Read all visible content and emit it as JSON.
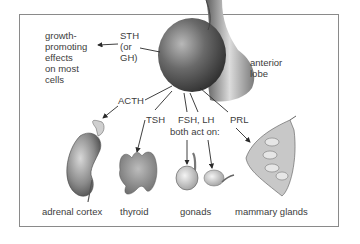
{
  "diagram": {
    "hormones": {
      "sth": "STH\n(or\nGH)",
      "acth": "ACTH",
      "tsh": "TSH",
      "fsh_lh": "FSH, LH",
      "fsh_lh_note": "both act on:",
      "prl": "PRL"
    },
    "source": {
      "label": "anterior\nlobe"
    },
    "effects": {
      "growth": "growth-\npromoting\neffects\non most\ncells"
    },
    "targets": [
      {
        "label": "adrenal cortex"
      },
      {
        "label": "thyroid"
      },
      {
        "label": "gonads"
      },
      {
        "label": "mammary glands"
      }
    ],
    "colors": {
      "frame": "#8a8a8a",
      "text": "#3c3c3c",
      "gland_dark": "#3a3a3a",
      "gland_light": "#a8a8a8"
    }
  }
}
